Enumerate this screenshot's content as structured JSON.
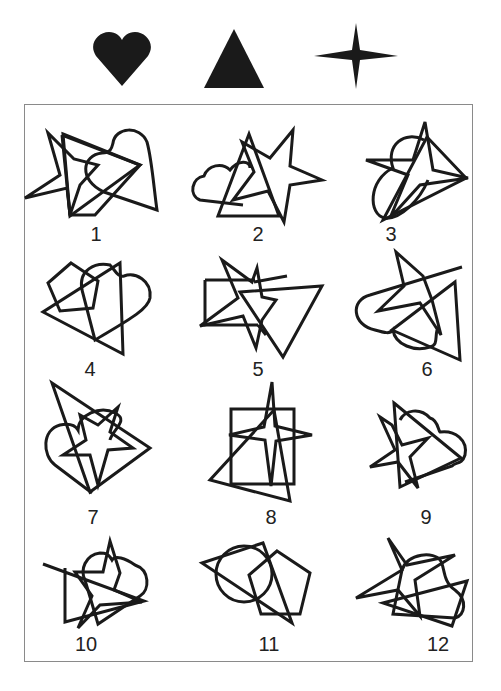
{
  "legend": {
    "shapes": [
      {
        "name": "heart",
        "color": "#1a1a1a"
      },
      {
        "name": "triangle",
        "color": "#1a1a1a"
      },
      {
        "name": "four-point-star",
        "color": "#1a1a1a"
      }
    ]
  },
  "figures": [
    {
      "number": "1",
      "shapes": [
        "five-point-star",
        "triangle",
        "heart"
      ]
    },
    {
      "number": "2",
      "shapes": [
        "cloud",
        "triangle",
        "five-point-star"
      ]
    },
    {
      "number": "3",
      "shapes": [
        "oval",
        "five-point-star",
        "triangle"
      ]
    },
    {
      "number": "4",
      "shapes": [
        "pentagon",
        "triangle",
        "heart"
      ]
    },
    {
      "number": "5",
      "shapes": [
        "rectangle",
        "five-point-star",
        "triangle"
      ]
    },
    {
      "number": "6",
      "shapes": [
        "cloud",
        "five-point-star",
        "triangle"
      ]
    },
    {
      "number": "7",
      "shapes": [
        "heart",
        "triangle",
        "five-point-star"
      ]
    },
    {
      "number": "8",
      "shapes": [
        "rectangle",
        "four-point-star",
        "triangle"
      ]
    },
    {
      "number": "9",
      "shapes": [
        "cloud",
        "five-point-star",
        "triangle"
      ]
    },
    {
      "number": "10",
      "shapes": [
        "five-point-star",
        "triangle",
        "heart"
      ]
    },
    {
      "number": "11",
      "shapes": [
        "circle",
        "triangle",
        "pentagon"
      ]
    },
    {
      "number": "12",
      "shapes": [
        "five-point-star",
        "triangle",
        "heart"
      ]
    }
  ],
  "colors": {
    "ink": "#1a1a1a",
    "frame": "#8a8a8a",
    "background": "#ffffff"
  }
}
